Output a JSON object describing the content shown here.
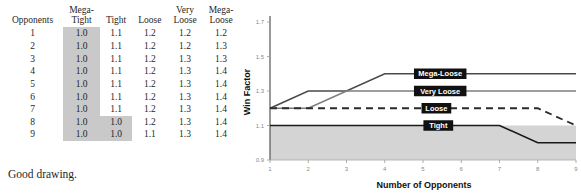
{
  "table": {
    "headers": [
      "Opponents",
      "Mega-\nTight",
      "Tight",
      "Loose",
      "Very\nLoose",
      "Mega-\nLoose"
    ],
    "rows": [
      [
        "1",
        "1.0",
        "1.1",
        "1.2",
        "1.2",
        "1.2"
      ],
      [
        "2",
        "1.0",
        "1.1",
        "1.2",
        "1.2",
        "1.3"
      ],
      [
        "3",
        "1.0",
        "1.1",
        "1.2",
        "1.3",
        "1.3"
      ],
      [
        "4",
        "1.0",
        "1.1",
        "1.2",
        "1.3",
        "1.4"
      ],
      [
        "5",
        "1.0",
        "1.1",
        "1.2",
        "1.3",
        "1.4"
      ],
      [
        "6",
        "1.0",
        "1.1",
        "1.2",
        "1.3",
        "1.4"
      ],
      [
        "7",
        "1.0",
        "1.1",
        "1.2",
        "1.3",
        "1.4"
      ],
      [
        "8",
        "1.0",
        "1.0",
        "1.2",
        "1.3",
        "1.4"
      ],
      [
        "9",
        "1.0",
        "1.0",
        "1.1",
        "1.3",
        "1.4"
      ]
    ],
    "shaded_cells": [
      [
        0,
        1
      ],
      [
        1,
        1
      ],
      [
        2,
        1
      ],
      [
        3,
        1
      ],
      [
        4,
        1
      ],
      [
        5,
        1
      ],
      [
        6,
        1
      ],
      [
        7,
        1
      ],
      [
        8,
        1
      ],
      [
        7,
        2
      ],
      [
        8,
        2
      ]
    ],
    "shade_color": "#c9c9c9"
  },
  "caption": "Good drawing.",
  "chart_data": {
    "type": "line",
    "title": "",
    "xlabel": "Number of Opponents",
    "ylabel": "Win Factor",
    "x": [
      1,
      2,
      3,
      4,
      5,
      6,
      7,
      8,
      9
    ],
    "xlim": [
      1,
      9
    ],
    "ylim": [
      0.9,
      1.7
    ],
    "xticks": [
      "1",
      "2",
      "3",
      "4",
      "5",
      "6",
      "7",
      "8",
      "9"
    ],
    "yticks": [
      "0.9",
      "1.1",
      "1.3",
      "1.5",
      "1.7"
    ],
    "grid": false,
    "legend_position": "inline-on-line",
    "shaded_band": {
      "from": 0.9,
      "to": 1.1,
      "color": "#d4d4d4"
    },
    "series": [
      {
        "name": "Mega-Loose",
        "values": [
          1.2,
          1.3,
          1.3,
          1.4,
          1.4,
          1.4,
          1.4,
          1.4,
          1.4
        ],
        "style": "solid",
        "color": "#4a4a4a",
        "label_x": 5.45
      },
      {
        "name": "Very Loose",
        "values": [
          1.2,
          1.2,
          1.3,
          1.3,
          1.3,
          1.3,
          1.3,
          1.3,
          1.3
        ],
        "style": "solid",
        "color": "#7d7d7d",
        "label_x": 5.45
      },
      {
        "name": "Loose",
        "values": [
          1.2,
          1.2,
          1.2,
          1.2,
          1.2,
          1.2,
          1.2,
          1.2,
          1.1
        ],
        "style": "dashed",
        "color": "#2b2b2b",
        "label_x": 5.35
      },
      {
        "name": "Tight",
        "values": [
          1.1,
          1.1,
          1.1,
          1.1,
          1.1,
          1.1,
          1.1,
          1.0,
          1.0
        ],
        "style": "solid",
        "color": "#1a1a1a",
        "label_x": 5.4
      }
    ]
  }
}
